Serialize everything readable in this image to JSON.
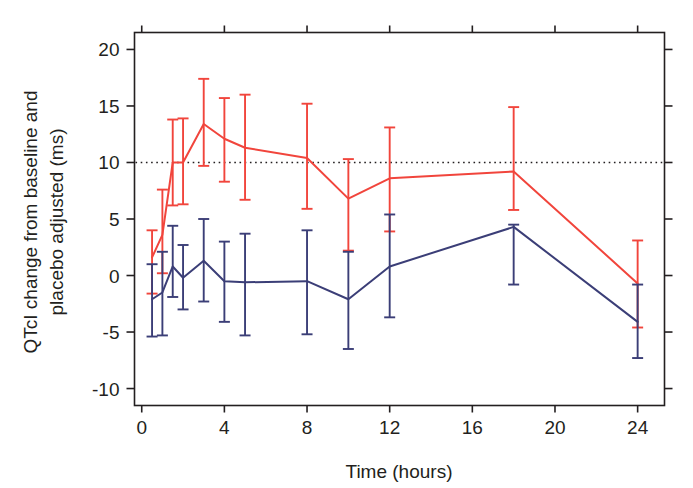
{
  "figure": {
    "title": "",
    "background": "#ffffff"
  },
  "chart_data": {
    "type": "line",
    "title": "",
    "subtitle": "",
    "xlabel": "Time (hours)",
    "ylabel": "QTcI change from baseline and placebo adjusted (ms)",
    "xlim": [
      -0.35,
      25.3
    ],
    "ylim": [
      -11.5,
      21.5
    ],
    "xticks": [
      0,
      4,
      8,
      12,
      16,
      20,
      24
    ],
    "xticklabels": [
      "0",
      "4",
      "8",
      "12",
      "16",
      "20",
      "24"
    ],
    "yticks": [
      20,
      15,
      10,
      5,
      0,
      -5,
      -10
    ],
    "yticklabels": [
      "20",
      "15",
      "10",
      "5",
      "0",
      "-5",
      "-10"
    ],
    "grid": false,
    "legend": null,
    "annotations": [
      {
        "kind": "horizontal-reference-line",
        "y": 10,
        "style": "dotted",
        "color": "#231f20",
        "label": "10 ms threshold"
      }
    ],
    "error_bar_kind": "90% confidence interval",
    "series": [
      {
        "name": "High dose",
        "color": "#f1453c",
        "x": [
          0.5,
          1.0,
          1.5,
          2.0,
          3.0,
          4.0,
          5.0,
          8.0,
          10.0,
          12.0,
          18.0,
          24.0
        ],
        "values": [
          1.6,
          3.6,
          10.0,
          10.0,
          13.4,
          12.1,
          11.3,
          10.4,
          6.8,
          8.6,
          9.2,
          -0.7
        ],
        "err_low": [
          -1.6,
          0.2,
          6.2,
          6.3,
          9.7,
          8.3,
          6.7,
          5.9,
          2.2,
          3.9,
          5.8,
          -4.6
        ],
        "err_high": [
          4.0,
          7.6,
          13.8,
          13.9,
          17.4,
          15.7,
          16.0,
          15.2,
          10.3,
          13.1,
          14.9,
          3.1
        ]
      },
      {
        "name": "Low dose",
        "color": "#3b3e77",
        "x": [
          0.5,
          1.0,
          1.5,
          2.0,
          3.0,
          4.0,
          5.0,
          8.0,
          10.0,
          12.0,
          18.0,
          24.0
        ],
        "values": [
          -2.1,
          -1.5,
          0.8,
          -0.2,
          1.3,
          -0.5,
          -0.6,
          -0.5,
          -2.1,
          0.8,
          4.3,
          -4.1
        ],
        "err_low": [
          -5.4,
          -5.3,
          -1.9,
          -3.0,
          -2.3,
          -4.1,
          -5.3,
          -5.2,
          -6.5,
          -3.7,
          -0.8,
          -7.3
        ],
        "err_high": [
          1.0,
          2.1,
          4.4,
          2.7,
          5.0,
          3.0,
          3.7,
          4.0,
          2.1,
          5.4,
          4.5,
          -0.8
        ]
      }
    ]
  },
  "axis": {
    "x_label": "Time (hours)",
    "y_label_line1": "QTcI change from baseline and",
    "y_label_line2": "placebo adjusted (ms)"
  }
}
